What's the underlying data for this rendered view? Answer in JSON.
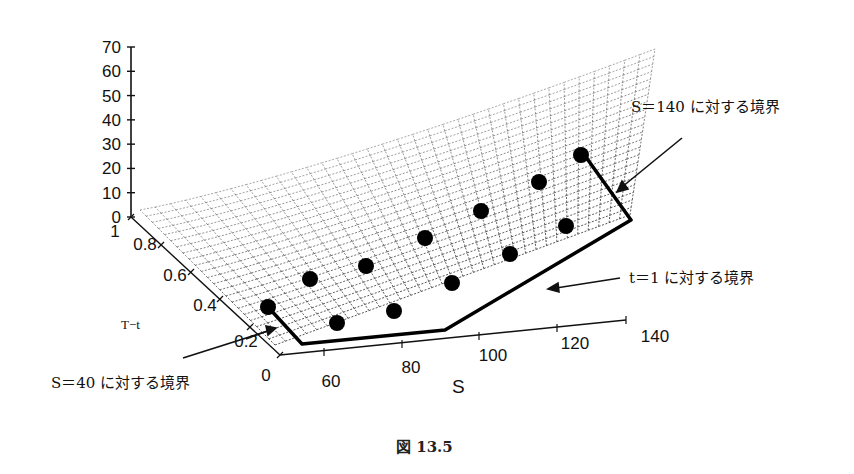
{
  "chart_data": {
    "type": "surface3d",
    "title": "",
    "caption": "図 13.5",
    "axes": {
      "z": {
        "label": "",
        "ticks": [
          "0",
          "10",
          "20",
          "30",
          "40",
          "50",
          "60",
          "70"
        ],
        "range": [
          0,
          70
        ]
      },
      "t": {
        "label": "T−t",
        "ticks": [
          "0",
          "0.2",
          "0.4",
          "0.6",
          "0.8",
          "1"
        ],
        "range": [
          0,
          1
        ]
      },
      "s": {
        "label": "S",
        "ticks": [
          "60",
          "80",
          "100",
          "120",
          "140"
        ],
        "range": [
          40,
          140
        ]
      }
    },
    "grid": true,
    "surface_style": "dashed wireframe mesh",
    "boundary_path": "thick black polyline along the S=40, t=1 and S=140 edges",
    "estimated_markers": {
      "note": "Approximate (S, T−t) positions of the black dots, estimated by eye from their on-screen placement. The chart prints no data labels for these points and the 3D projection makes the mapping imprecise. These are NOT values read from the chart.",
      "points": [
        {
          "s": 40,
          "t": 0.4
        },
        {
          "s": 55,
          "t": 0.5
        },
        {
          "s": 65,
          "t": 0.6
        },
        {
          "s": 80,
          "t": 0.45
        },
        {
          "s": 90,
          "t": 0.55
        },
        {
          "s": 100,
          "t": 0.6
        },
        {
          "s": 110,
          "t": 0.7
        },
        {
          "s": 120,
          "t": 0.8
        },
        {
          "s": 125,
          "t": 0.55
        },
        {
          "s": 130,
          "t": 0.65
        },
        {
          "s": 140,
          "t": 0.75
        },
        {
          "s": 60,
          "t": 0.3
        },
        {
          "s": 75,
          "t": 0.35
        },
        {
          "s": 95,
          "t": 0.4
        }
      ]
    },
    "annotations": [
      {
        "text": "S＝140 に対する境界",
        "target": "S=140 boundary"
      },
      {
        "text": "t＝1 に対する境界",
        "target": "t=1 boundary"
      },
      {
        "text": "S＝40 に対する境界",
        "target": "S=40 boundary"
      }
    ]
  }
}
